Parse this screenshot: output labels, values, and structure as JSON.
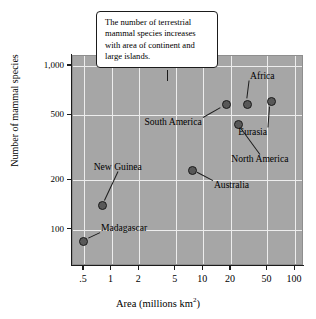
{
  "chart_data": {
    "type": "scatter",
    "title": "",
    "xlabel": "Area (millions km2)",
    "xlabel_base": "Area (millions km",
    "xlabel_sup": "2",
    "xlabel_tail": ")",
    "ylabel": "Number of mammal species",
    "xscale": "log",
    "yscale": "log",
    "xlim": [
      0.38,
      125
    ],
    "ylim": [
      60,
      1150
    ],
    "grid": true,
    "legend": "none",
    "xticks": [
      {
        "label": ".5",
        "value": 0.5
      },
      {
        "label": "1",
        "value": 1
      },
      {
        "label": "2",
        "value": 2
      },
      {
        "label": "5",
        "value": 5
      },
      {
        "label": "10",
        "value": 10
      },
      {
        "label": "20",
        "value": 20
      },
      {
        "label": "50",
        "value": 50
      },
      {
        "label": "100",
        "value": 100
      }
    ],
    "yticks": [
      {
        "label": "1,000",
        "value": 1000
      },
      {
        "label": "500",
        "value": 500
      },
      {
        "label": "200",
        "value": 200
      },
      {
        "label": "100",
        "value": 100
      }
    ],
    "points": [
      {
        "name": "Madagascar",
        "x": 0.5,
        "y": 85,
        "label_dx": 18,
        "label_dy": -12,
        "label_anchor": "left"
      },
      {
        "name": "New Guinea",
        "x": 0.8,
        "y": 140,
        "label_dx": -8,
        "label_dy": -38,
        "label_anchor": "left"
      },
      {
        "name": "Australia",
        "x": 7.7,
        "y": 230,
        "label_dx": 22,
        "label_dy": 16,
        "label_anchor": "left"
      },
      {
        "name": "South America",
        "x": 18,
        "y": 580,
        "label_dx": -24,
        "label_dy": 18,
        "label_anchor": "right"
      },
      {
        "name": "Africa",
        "x": 30,
        "y": 580,
        "label_dx": 4,
        "label_dy": -28,
        "label_anchor": "left"
      },
      {
        "name": "North America",
        "x": 24,
        "y": 440,
        "label_dx": -6,
        "label_dy": 36,
        "label_anchor": "left"
      },
      {
        "name": "Eurasia",
        "x": 55,
        "y": 610,
        "label_dx": -32,
        "label_dy": 32,
        "label_anchor": "left"
      }
    ],
    "annotation": {
      "line1": "The number of terrestrial",
      "line2": "mammal species increases",
      "line3": "with area of continent and",
      "line4": "large islands."
    },
    "colors": {
      "panel": "#a6a6a6",
      "gridline": "#ededed",
      "marker_fill": "#585858",
      "marker_edge": "#1b1b1b",
      "axis": "#1b1b1b",
      "callout_bg": "#ffffff",
      "text": "#000000"
    }
  }
}
